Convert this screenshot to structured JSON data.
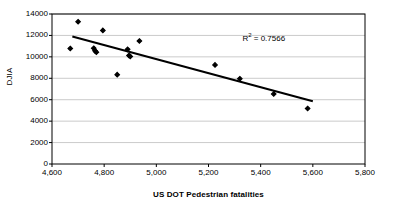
{
  "chart_data": {
    "type": "scatter",
    "title": "",
    "xlabel": "US DOT Pedestrian fatalities",
    "ylabel": "DJIA",
    "xlim": [
      4600,
      5800
    ],
    "ylim": [
      0,
      14000
    ],
    "grid": true,
    "grid_axis": "y",
    "legend": "none",
    "x_ticks": [
      "4,600",
      "4,800",
      "5,000",
      "5,200",
      "5,400",
      "5,600",
      "5,800"
    ],
    "x_tick_values": [
      4600,
      4800,
      5000,
      5200,
      5400,
      5600,
      5800
    ],
    "y_ticks": [
      "0",
      "2000",
      "4000",
      "6000",
      "8000",
      "10000",
      "12000",
      "14000"
    ],
    "y_tick_values": [
      0,
      2000,
      4000,
      6000,
      8000,
      10000,
      12000,
      14000
    ],
    "annotations": [
      {
        "name": "r-squared",
        "text_prefix": "R",
        "text_sup": "2",
        "text_suffix": " = 0.7566",
        "value": 0.7566,
        "x": 5330,
        "y": 11700
      }
    ],
    "series": [
      {
        "name": "DJIA vs US DOT Pedestrian fatalities",
        "marker": "diamond",
        "color": "#000000",
        "points": [
          {
            "x": 4670,
            "y": 10780
          },
          {
            "x": 4700,
            "y": 13280
          },
          {
            "x": 4760,
            "y": 10800
          },
          {
            "x": 4765,
            "y": 10560
          },
          {
            "x": 4770,
            "y": 10440
          },
          {
            "x": 4795,
            "y": 12470
          },
          {
            "x": 4850,
            "y": 8340
          },
          {
            "x": 4890,
            "y": 10700
          },
          {
            "x": 4895,
            "y": 10130
          },
          {
            "x": 4900,
            "y": 10030
          },
          {
            "x": 4935,
            "y": 11480
          },
          {
            "x": 5225,
            "y": 9250
          },
          {
            "x": 5320,
            "y": 7960
          },
          {
            "x": 5450,
            "y": 6530
          },
          {
            "x": 5580,
            "y": 5180
          }
        ]
      }
    ],
    "trendline": {
      "name": "linear-trendline",
      "color": "#000000",
      "x1": 4678,
      "y1": 11900,
      "x2": 5600,
      "y2": 5850
    }
  }
}
